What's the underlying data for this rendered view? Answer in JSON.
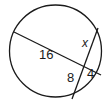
{
  "diagram": {
    "type": "intersecting-chords-in-circle",
    "circle": {
      "cx": 55.5,
      "cy": 51,
      "r": 46,
      "stroke": "#1a1a1a"
    },
    "chords": [
      {
        "name": "chord-a",
        "x1": 14,
        "y1": 32,
        "x2": 101,
        "y2": 75
      },
      {
        "name": "chord-b",
        "x1": 98,
        "y1": 28,
        "x2": 72,
        "y2": 99
      }
    ],
    "intersection": {
      "x": 86,
      "y": 63
    },
    "labels": {
      "segment_long": "16",
      "segment_unknown": "x",
      "segment_lower": "8",
      "segment_short": "4"
    }
  }
}
